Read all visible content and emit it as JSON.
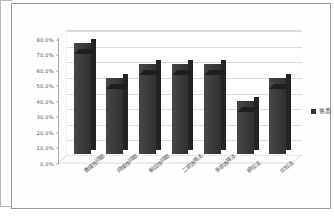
{
  "chart_data": {
    "type": "bar",
    "title": "",
    "subtitle": "",
    "xlabel": "",
    "ylabel": "",
    "ylim": [
      0,
      80
    ],
    "grid": true,
    "legend_position": "right",
    "three_d": true,
    "categories": [
      "直接性问题",
      "间接性问题",
      "假设性问题",
      "二项选择法",
      "多项选择法",
      "顺位法",
      "比较法"
    ],
    "series": [
      {
        "name": "熟悉",
        "color": "#3a3a3a",
        "values": [
          71.5,
          49.0,
          58.0,
          58.0,
          58.0,
          34.0,
          49.0
        ]
      }
    ],
    "y_ticks": [
      "0.0%",
      "10.0%",
      "20.0%",
      "30.0%",
      "40.0%",
      "50.0%",
      "60.0%",
      "70.0%",
      "80.0%"
    ],
    "y_tick_values": [
      0,
      10,
      20,
      30,
      40,
      50,
      60,
      70,
      80
    ]
  },
  "legend": {
    "entries": [
      {
        "label": "熟悉",
        "swatch_color": "#303030"
      }
    ]
  },
  "colors": {
    "bar_front": "#3a3a3a",
    "bar_side": "#232323",
    "bar_top": "#1c1c1c",
    "gridline": "#dcdcdc",
    "axis": "#a9a9a9",
    "frame": "#9a9a9a",
    "background": "#ffffff",
    "tick_text": "#555555",
    "label_text": "#4a4a4a"
  }
}
